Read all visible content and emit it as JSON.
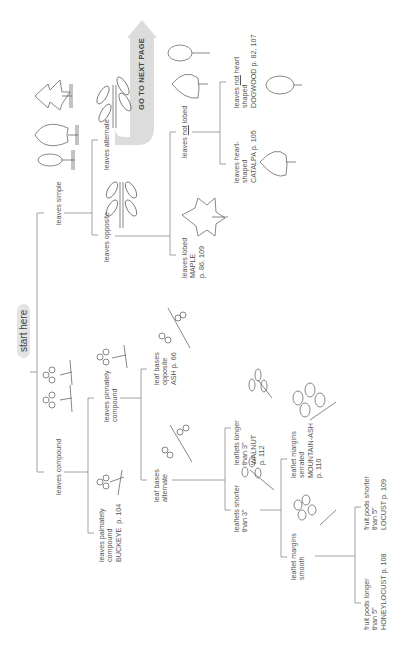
{
  "diagram": {
    "start_label": "start here",
    "go_next_page": "GO TO NEXT PAGE",
    "arrow_color": "#d9d9d9",
    "line_color": "#888888",
    "nodes": {
      "leaves_simple": "leaves simple",
      "leaves_compound": "leaves compound",
      "leaves_alternate": "leaves alternate",
      "leaves_opposite": "leaves opposite",
      "leaves_not_lobed_pre": "leaves ",
      "leaves_not_lobed_u": "not",
      "leaves_not_lobed_post": " lobed",
      "leaves_lobed": "leaves lobed\nMAPLE\np. 86, 109",
      "heart_shaped": "leaves heart-\nshaped\nCATALPA p. 105",
      "not_heart_l1_pre": "leaves ",
      "not_heart_l1_u": "not",
      "not_heart_l1_post": " heart",
      "not_heart_rest": "shaped\nDOGWOOD p. 82, 107",
      "pinnately_compound": "leaves pinnately\ncompound",
      "palmately_compound": "leaves palmately\ncompound\nBUCKEYE  p. 104",
      "leaf_bases_opposite": "leaf bases\nopposite\nASH p. 66",
      "leaf_bases_alternate": "leaf bases\nalternate",
      "leaflets_longer": "leaflets longer\nthan 3\"\nWALNUT\np. 112",
      "leaflets_shorter": "leaflets shorter\nthan 3\"",
      "margins_serrated": "leaflet margins\nserrated\nMOUNTAIN-ASH\np. 110",
      "margins_smooth": "leaflet margins\nsmooth",
      "pods_shorter": "fruit pods shorter\nthan 5\"\nLOCUST p. 109",
      "pods_longer": "fruit pods longer\nthan 5\"\nHONEYLOCUST p. 108"
    },
    "icons": [
      "simple-leaf-icon",
      "serrated-leaf-icon",
      "lobed-leaf-icon",
      "alternate-branch-icon",
      "opposite-branch-icon",
      "oval-leaf-icon",
      "heart-leaf-icon",
      "maple-leaf-icon",
      "pinnate-leaf-icon",
      "palmate-leaf-icon",
      "compound-twig-icon"
    ]
  }
}
